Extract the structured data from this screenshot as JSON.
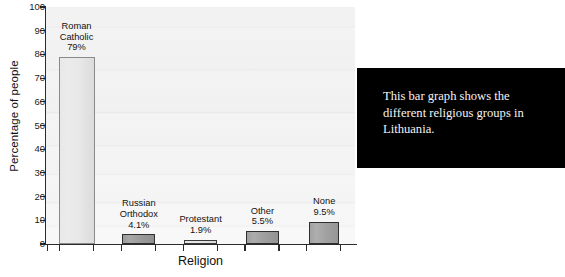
{
  "chart_data": {
    "type": "bar",
    "title": "",
    "xlabel": "Religion",
    "ylabel": "Percentage of people",
    "ylim": [
      0,
      100
    ],
    "ytick_step": 10,
    "yticks": [
      "100",
      "90",
      "80",
      "70",
      "60",
      "50",
      "40",
      "30",
      "20",
      "10",
      "0"
    ],
    "grid": false,
    "legend": "none",
    "categories": [
      "Roman Catholic",
      "Russian Orthodox",
      "Protestant",
      "Other",
      "None"
    ],
    "values": [
      79,
      4.1,
      1.9,
      5.5,
      9.5
    ],
    "bars": [
      {
        "category": "Roman Catholic",
        "label_line1": "Roman",
        "label_line2": "Catholic",
        "value": 79,
        "value_label": "79%",
        "fill": "#e8e8e8",
        "stroke": "#8a8a8a"
      },
      {
        "category": "Russian Orthodox",
        "label_line1": "Russian",
        "label_line2": "Orthodox",
        "value": 4.1,
        "value_label": "4.1%",
        "fill": "#9b9b9b",
        "stroke": "#2f2f2f"
      },
      {
        "category": "Protestant",
        "label_line1": "Protestant",
        "label_line2": "",
        "value": 1.9,
        "value_label": "1.9%",
        "fill": "#e4e4e4",
        "stroke": "#3a3a3a"
      },
      {
        "category": "Other",
        "label_line1": "Other",
        "label_line2": "",
        "value": 5.5,
        "value_label": "5.5%",
        "fill": "#9f9f9f",
        "stroke": "#2f2f2f"
      },
      {
        "category": "None",
        "label_line1": "None",
        "label_line2": "",
        "value": 9.5,
        "value_label": "9.5%",
        "fill": "#a2a2a2",
        "stroke": "#2f2f2f"
      }
    ]
  },
  "caption": {
    "text": "This bar graph shows the different religious groups in Lithuania.",
    "background": "#000000",
    "color": "#f4f4f4"
  }
}
